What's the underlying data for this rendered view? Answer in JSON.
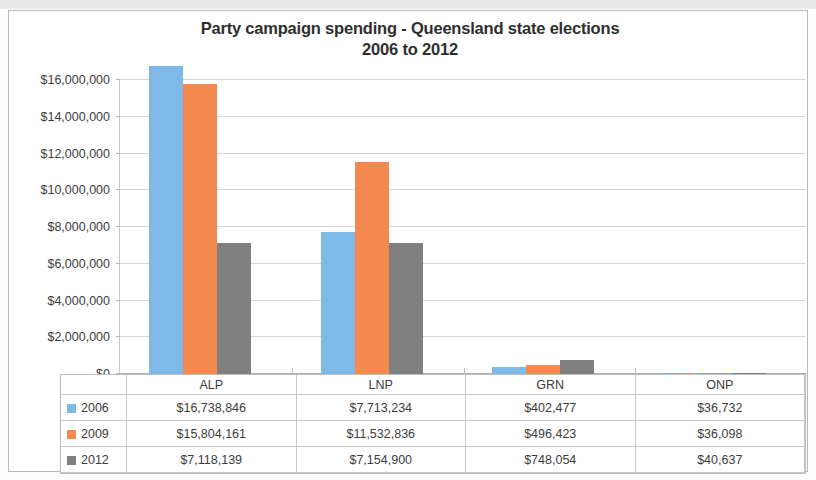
{
  "chart_data": {
    "type": "bar",
    "title": "Party campaign spending - Queensland state elections 2006 to 2012",
    "title_line1": "Party campaign spending - Queensland state elections",
    "title_line2": "2006 to 2012",
    "xlabel": "",
    "ylabel": "",
    "ylim": [
      0,
      16000000
    ],
    "grid": true,
    "legend_position": "table-bottom-left",
    "categories": [
      "ALP",
      "LNP",
      "GRN",
      "ONP"
    ],
    "series": [
      {
        "name": "2006",
        "color": "#7EB9E8",
        "values": [
          16738846,
          7713234,
          402477,
          36732
        ],
        "labels": [
          "$16,738,846",
          "$7,713,234",
          "$402,477",
          "$36,732"
        ]
      },
      {
        "name": "2009",
        "color": "#F4894F",
        "values": [
          15804161,
          11532836,
          496423,
          36098
        ],
        "labels": [
          "$15,804,161",
          "$11,532,836",
          "$496,423",
          "$36,098"
        ]
      },
      {
        "name": "2012",
        "color": "#808080",
        "values": [
          7118139,
          7154900,
          748054,
          40637
        ],
        "labels": [
          "$7,118,139",
          "$7,154,900",
          "$748,054",
          "$40,637"
        ]
      }
    ],
    "y_ticks": [
      0,
      2000000,
      4000000,
      6000000,
      8000000,
      10000000,
      12000000,
      14000000,
      16000000
    ],
    "y_tick_labels": [
      "$0",
      "$2,000,000",
      "$4,000,000",
      "$6,000,000",
      "$8,000,000",
      "$10,000,000",
      "$12,000,000",
      "$14,000,000",
      "$16,000,000"
    ]
  },
  "table": {
    "corner_label": "",
    "column_headers": [
      "ALP",
      "LNP",
      "GRN",
      "ONP"
    ],
    "rows": [
      {
        "series": "2006",
        "color": "#7EB9E8",
        "cells": [
          "$16,738,846",
          "$7,713,234",
          "$402,477",
          "$36,732"
        ]
      },
      {
        "series": "2009",
        "color": "#F4894F",
        "cells": [
          "$15,804,161",
          "$11,532,836",
          "$496,423",
          "$36,098"
        ]
      },
      {
        "series": "2012",
        "color": "#808080",
        "cells": [
          "$7,118,139",
          "$7,154,900",
          "$748,054",
          "$40,637"
        ]
      }
    ]
  }
}
